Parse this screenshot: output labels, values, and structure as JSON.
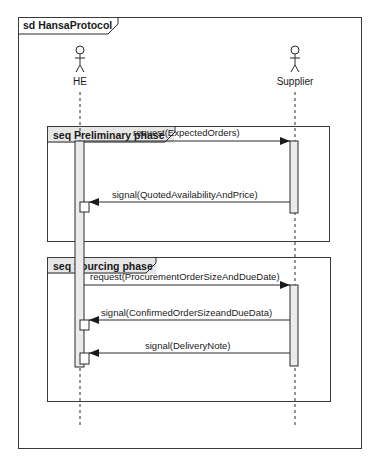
{
  "diagram": {
    "title": "sd HansaProtocol",
    "actors": [
      {
        "name": "HE",
        "x": 80
      },
      {
        "name": "Supplier",
        "x": 295
      }
    ],
    "fragments": [
      {
        "label": "seq Preliminary phase",
        "messages": [
          {
            "text": "request(ExpectedOrders)",
            "from": "HE",
            "to": "Supplier",
            "kind": "call"
          },
          {
            "text": "signal(QuotedAvailabilityAndPrice)",
            "from": "Supplier",
            "to": "HE",
            "kind": "signal"
          }
        ]
      },
      {
        "label": "seq Sourcing phase",
        "messages": [
          {
            "text": "request(ProcurementOrderSizeAndDueDate)",
            "from": "HE",
            "to": "Supplier",
            "kind": "call"
          },
          {
            "text": "signal(ConfirmedOrderSizeandDueData)",
            "from": "Supplier",
            "to": "HE",
            "kind": "signal"
          },
          {
            "text": "signal(DeliveryNote)",
            "from": "Supplier",
            "to": "HE",
            "kind": "signal"
          }
        ]
      }
    ],
    "colors": {
      "line": "#2a2a2a",
      "header_fill": "#e6e6e6",
      "activation_fill": "#ebebeb"
    }
  }
}
